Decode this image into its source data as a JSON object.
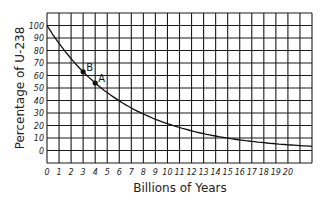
{
  "chart_data": {
    "type": "line",
    "title": "",
    "xlabel": "Billions of Years",
    "ylabel": "Percentage of U-238",
    "xlim": [
      0,
      22
    ],
    "ylim": [
      -10,
      110
    ],
    "x_ticks": [
      "0",
      "1",
      "2",
      "3",
      "4",
      "5",
      "6",
      "7",
      "8",
      "9",
      "10",
      "11",
      "12",
      "13",
      "14",
      "15",
      "16",
      "17",
      "18",
      "19",
      "20"
    ],
    "y_ticks": [
      "0",
      "10",
      "20",
      "30",
      "40",
      "50",
      "60",
      "70",
      "80",
      "90",
      "100"
    ],
    "grid": true,
    "series": [
      {
        "name": "U-238 decay",
        "half_life": 4.5,
        "x": [
          0,
          1,
          2,
          3,
          4,
          5,
          6,
          7,
          8,
          9,
          10,
          11,
          12,
          13,
          14,
          15,
          16,
          17,
          18,
          19,
          20,
          21,
          22
        ],
        "values": [
          100,
          85.7,
          73.4,
          62.9,
          53.9,
          46.3,
          39.7,
          34.0,
          29.1,
          25.0,
          21.4,
          18.4,
          15.7,
          13.5,
          11.6,
          9.9,
          8.5,
          7.3,
          6.2,
          5.3,
          4.6,
          3.9,
          3.4
        ]
      }
    ],
    "annotations": [
      {
        "label": "B",
        "x": 3,
        "y": 63
      },
      {
        "label": "A",
        "x": 4,
        "y": 54
      }
    ]
  }
}
